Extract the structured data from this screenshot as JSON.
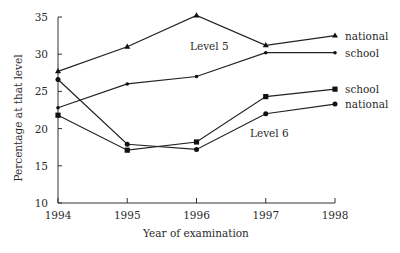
{
  "chart_data": {
    "type": "line",
    "title": "",
    "xlabel": "Year of examination",
    "ylabel": "Percentage at that level",
    "ylim": [
      10,
      35
    ],
    "yticks": [
      10,
      15,
      20,
      25,
      30,
      35
    ],
    "x": [
      "1994",
      "1995",
      "1996",
      "1997",
      "1998"
    ],
    "grid": false,
    "legend_position": "inline-right",
    "annotations": [
      "Level 5",
      "Level 6"
    ],
    "series": [
      {
        "name": "Level 5 national",
        "label": "national",
        "marker": "triangle",
        "values": [
          27.7,
          31.0,
          35.2,
          31.2,
          32.5
        ]
      },
      {
        "name": "Level 5 school",
        "label": "school",
        "marker": "dot",
        "values": [
          22.8,
          26.0,
          27.0,
          30.2,
          30.2
        ]
      },
      {
        "name": "Level 6 school",
        "label": "school",
        "marker": "square",
        "values": [
          21.8,
          17.1,
          18.2,
          24.3,
          25.3
        ]
      },
      {
        "name": "Level 6 national",
        "label": "national",
        "marker": "circle",
        "values": [
          26.6,
          17.9,
          17.2,
          22.0,
          23.3
        ]
      }
    ]
  },
  "labels": {
    "level5": "Level 5",
    "level6": "Level 6"
  }
}
